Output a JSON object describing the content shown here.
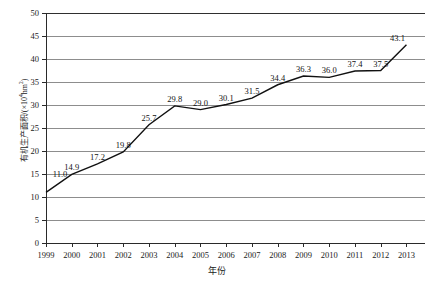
{
  "chart_data": {
    "type": "line",
    "title": "",
    "xlabel": "年份",
    "ylabel": "有机生产面积/(×10⁴hm²)",
    "ylabel_prefix": "有机生产面积/(×10",
    "ylabel_sup": "4",
    "ylabel_suffix": "hm",
    "ylabel_sup2": "2",
    "ylabel_end": ")",
    "categories": [
      "1999",
      "2000",
      "2001",
      "2002",
      "2003",
      "2004",
      "2005",
      "2006",
      "2007",
      "2008",
      "2009",
      "2010",
      "2011",
      "2012",
      "2013"
    ],
    "values": [
      11.0,
      14.9,
      17.2,
      19.8,
      25.7,
      29.8,
      29.0,
      30.1,
      31.5,
      34.4,
      36.3,
      36.0,
      37.4,
      37.5,
      43.1
    ],
    "point_labels": [
      "11.0",
      "14.9",
      "17.2",
      "19.8",
      "25.7",
      "29.8",
      "29.0",
      "30.1",
      "31.5",
      "34.4",
      "36.3",
      "36.0",
      "37.4",
      "37.5",
      "43.1"
    ],
    "ylim": [
      0,
      50
    ],
    "yticks": [
      0,
      5,
      10,
      15,
      20,
      25,
      30,
      35,
      40,
      45,
      50
    ],
    "ytick_labels": [
      "0",
      "5",
      "10",
      "15",
      "20",
      "25",
      "30",
      "35",
      "40",
      "45",
      "50"
    ],
    "grid": true,
    "legend": false,
    "line_color": "#111111",
    "grid_color": "#8d8d8d",
    "axis_color": "#2a2a2a"
  }
}
